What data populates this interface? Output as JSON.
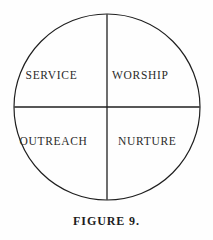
{
  "figure": {
    "caption": "FIGURE 9.",
    "shape": "circle-divided-into-four-quadrants",
    "background_color": "#fefefe",
    "stroke_color": "#1f1f1f",
    "text_color": "#2a2a2a"
  },
  "diagram": {
    "circle": {
      "center_x": 107,
      "center_y": 107,
      "radius": 93,
      "stroke_width": 1.2
    },
    "dividers": [
      {
        "name": "vertical-divider",
        "x1": 107,
        "y1": 14,
        "x2": 107,
        "y2": 200
      },
      {
        "name": "horizontal-divider",
        "x1": 14,
        "y1": 107,
        "x2": 200,
        "y2": 107
      }
    ],
    "quadrants": [
      {
        "position": "upper-left",
        "label": "SERVICE"
      },
      {
        "position": "upper-right",
        "label": "WORSHIP"
      },
      {
        "position": "lower-left",
        "label": "OUTREACH"
      },
      {
        "position": "lower-right",
        "label": "NURTURE"
      }
    ]
  }
}
